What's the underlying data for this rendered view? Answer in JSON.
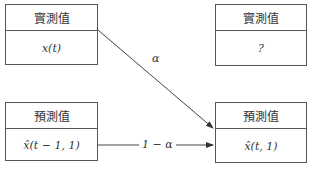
{
  "diagram": {
    "top_left": {
      "header": "實測值",
      "body": "x(t)"
    },
    "top_right": {
      "header": "實測值",
      "body": "?"
    },
    "bottom_left": {
      "header": "預測值",
      "body": "x̂(t − 1, 1)"
    },
    "bottom_right": {
      "header": "預測值",
      "body": "x̂(t, 1)"
    },
    "edges": [
      {
        "from": "top_left",
        "to": "bottom_right",
        "label": "α"
      },
      {
        "from": "bottom_left",
        "to": "bottom_right",
        "label": "1 − α"
      }
    ],
    "footer_partial": "…"
  }
}
